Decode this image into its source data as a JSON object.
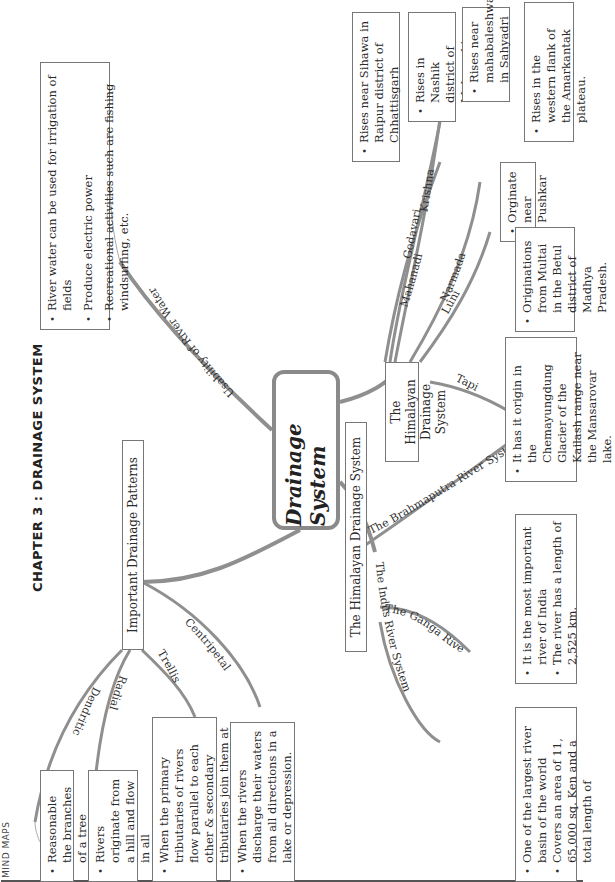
{
  "header": {
    "label": "MIND MAPS"
  },
  "chapter_title": "CHAPTER 3 : DRAINAGE SYSTEM",
  "central_node": {
    "label": "Drainage System"
  },
  "usability": {
    "branch_label": "Usability of River Water",
    "points": [
      "River water can be used for irrigation of fields",
      "Produce electric power",
      "Recreational activities such are fishing windsurfing, etc."
    ]
  },
  "patterns": {
    "node_label": "Important Drainage Patterns",
    "items": [
      {
        "label": "Dendritic",
        "points": [
          "Reasonable the branches of a tree"
        ]
      },
      {
        "label": "Radial",
        "points": [
          "Rivers originate from a hill and flow in all directions"
        ]
      },
      {
        "label": "Trellis",
        "points": [
          "When the primary tributaries of rivers flow parallel to each other & secondary tributaries join them at right angles."
        ]
      },
      {
        "label": "Centripetal",
        "points": [
          "When the rivers discharge their waters from all directions in a lake or depression."
        ]
      }
    ]
  },
  "himalayan": {
    "node_label": "The Himalayan Drainage System",
    "items": [
      {
        "label": "The Indus River System",
        "points": [
          "One of the largest river basin of the world",
          "Covers an area of 11, 65,000 sq. Ken and a total length of"
        ]
      },
      {
        "label": "The Ganga River System",
        "points": [
          "It is the most important river of India",
          "The river has a length of 2,525 km."
        ]
      },
      {
        "label": "The Brahmaputra River System",
        "points": [
          "It has it origin in the Chemayungdung Glacier of the Kailash range near the Mansarovar lake."
        ]
      }
    ]
  },
  "peninsular": {
    "node_label": "The Himalayan Drainage System",
    "items": [
      {
        "label": "Mahanadi",
        "points": [
          "Rises near Sihawa in Raipur district of Chhattisgarh"
        ]
      },
      {
        "label": "Godavari",
        "points": [
          "Rises in Nashik district of Maharashtra"
        ]
      },
      {
        "label": "Krishna",
        "points": [
          "Rises near mahabaleshwar in Sahyadri"
        ]
      },
      {
        "label": "Narmada",
        "points": [
          "Rises in the western flank of the Amarkantak plateau."
        ]
      },
      {
        "label": "Luni",
        "points": [
          "Orginate near Pushkar"
        ]
      },
      {
        "label": "Tapi",
        "points": [
          "Originations from Multai in the Betul district of Madhya Pradesh."
        ]
      }
    ]
  },
  "colors": {
    "branch": "#8f8f8f",
    "border": "#777777",
    "text": "#2a2a2a"
  }
}
